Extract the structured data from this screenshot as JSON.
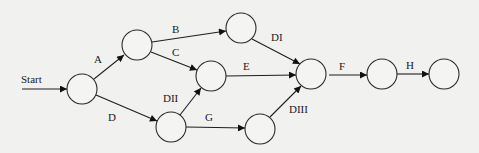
{
  "diagram": {
    "type": "activity-on-arrow network",
    "start_label": "Start",
    "nodes": [
      {
        "id": "n1",
        "cx": 82,
        "cy": 89,
        "r": 15
      },
      {
        "id": "n2",
        "cx": 137,
        "cy": 45,
        "r": 15
      },
      {
        "id": "n3",
        "cx": 241,
        "cy": 28,
        "r": 15
      },
      {
        "id": "n4",
        "cx": 211,
        "cy": 76,
        "r": 15
      },
      {
        "id": "n5",
        "cx": 171,
        "cy": 127,
        "r": 15
      },
      {
        "id": "n6",
        "cx": 260,
        "cy": 129,
        "r": 15
      },
      {
        "id": "n7",
        "cx": 311,
        "cy": 74,
        "r": 15
      },
      {
        "id": "n8",
        "cx": 382,
        "cy": 74,
        "r": 15
      },
      {
        "id": "n9",
        "cx": 444,
        "cy": 74,
        "r": 15
      }
    ],
    "edges": [
      {
        "id": "start",
        "from": "start",
        "to": "n1",
        "label": "Start"
      },
      {
        "id": "A",
        "from": "n1",
        "to": "n2",
        "label": "A"
      },
      {
        "id": "B",
        "from": "n2",
        "to": "n3",
        "label": "B"
      },
      {
        "id": "C",
        "from": "n2",
        "to": "n4",
        "label": "C"
      },
      {
        "id": "D",
        "from": "n1",
        "to": "n5",
        "label": "D"
      },
      {
        "id": "DI",
        "from": "n3",
        "to": "n7",
        "label": "DI"
      },
      {
        "id": "E",
        "from": "n4",
        "to": "n7",
        "label": "E"
      },
      {
        "id": "DII",
        "from": "n5",
        "to": "n4",
        "label": "DII"
      },
      {
        "id": "G",
        "from": "n5",
        "to": "n6",
        "label": "G"
      },
      {
        "id": "DIII",
        "from": "n6",
        "to": "n7",
        "label": "DIII"
      },
      {
        "id": "F",
        "from": "n7",
        "to": "n8",
        "label": "F"
      },
      {
        "id": "H",
        "from": "n8",
        "to": "n9",
        "label": "H"
      }
    ],
    "labels": {
      "start": "Start",
      "A": "A",
      "B": "B",
      "C": "C",
      "D": "D",
      "DI": "DI",
      "E": "E",
      "DII": "DII",
      "G": "G",
      "DIII": "DIII",
      "F": "F",
      "H": "H"
    },
    "colors": {
      "background": "#f1f1f0",
      "line": "#1e1e1e",
      "node_fill": "#f4f4f3"
    }
  }
}
